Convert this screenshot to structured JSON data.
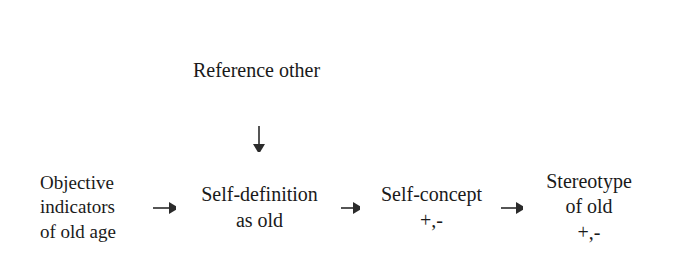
{
  "diagram": {
    "background_color": "#ffffff",
    "line_color": "#2b2b2b",
    "text_color": "#1a1a1a",
    "nodes": {
      "reference": {
        "id": "reference-other",
        "lines": [
          "Reference other"
        ]
      },
      "objective": {
        "id": "objective-indicators",
        "lines": [
          "Objective",
          "indicators",
          "of old age"
        ]
      },
      "self_definition": {
        "id": "self-definition-as-old",
        "lines": [
          "Self-definition",
          "as old"
        ]
      },
      "self_concept": {
        "id": "self-concept",
        "lines": [
          "Self-concept",
          "+,-"
        ]
      },
      "stereotype": {
        "id": "stereotype-of-old",
        "lines": [
          "Stereotype",
          "of old",
          "+,-"
        ]
      }
    },
    "edges": [
      {
        "id": "reference-to-self-definition",
        "from": "reference-other",
        "to": "self-definition-as-old",
        "direction": "down",
        "arrowhead": "filled-triangle"
      },
      {
        "id": "objective-to-self-definition",
        "from": "objective-indicators",
        "to": "self-definition-as-old",
        "direction": "right",
        "arrowhead": "filled-triangle"
      },
      {
        "id": "self-definition-to-self-concept",
        "from": "self-definition-as-old",
        "to": "self-concept",
        "direction": "right",
        "arrowhead": "filled-triangle"
      },
      {
        "id": "self-concept-to-stereotype",
        "from": "self-concept",
        "to": "stereotype-of-old",
        "direction": "right",
        "arrowhead": "filled-triangle"
      }
    ]
  }
}
